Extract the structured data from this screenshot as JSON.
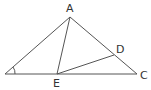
{
  "diagram": {
    "type": "geometry-triangle",
    "points": {
      "A": {
        "label": "A",
        "x": 70,
        "y": 17
      },
      "B": {
        "label": "",
        "x": 5,
        "y": 74
      },
      "C": {
        "label": "C",
        "x": 137,
        "y": 74
      },
      "D": {
        "label": "D",
        "x": 114,
        "y": 55
      },
      "E": {
        "label": "E",
        "x": 57,
        "y": 74
      }
    },
    "segments": [
      "AB",
      "AC",
      "BC",
      "AE",
      "ED"
    ],
    "angle_mark": {
      "at": "B",
      "label": "1"
    }
  }
}
